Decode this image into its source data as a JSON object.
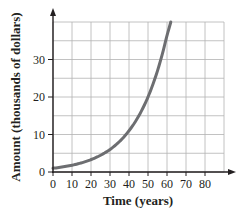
{
  "chart_data": {
    "type": "line",
    "title": "",
    "xlabel": "Time (years)",
    "ylabel": "Amount (thousands of dollars)",
    "xlim": [
      0,
      90
    ],
    "ylim": [
      0,
      40
    ],
    "x_ticks": [
      0,
      10,
      20,
      30,
      40,
      50,
      60,
      70,
      80
    ],
    "y_ticks": [
      0,
      10,
      20,
      30
    ],
    "grid": true,
    "grid_x_step": 10,
    "grid_y_step": 5,
    "legend": null,
    "series": [
      {
        "name": "Amount",
        "color": "#6d6e71",
        "x": [
          0,
          10,
          20,
          30,
          40,
          50,
          55,
          60,
          62
        ],
        "y": [
          1,
          1.8,
          3.3,
          6,
          11,
          20,
          27,
          36.5,
          40
        ]
      }
    ]
  },
  "colors": {
    "axis": "#231f20",
    "grid": "#b3b3b3",
    "curve": "#6d6e71"
  }
}
